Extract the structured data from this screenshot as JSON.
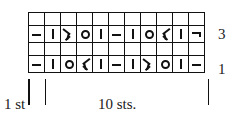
{
  "figure": {
    "kind": "knitting-stitch-chart",
    "background_color": "#ffffff",
    "line_color": "#111111"
  },
  "chart_data": {
    "type": "heatmap",
    "title": "",
    "subtitle": "",
    "xlabel": "",
    "ylabel": "",
    "grid": true,
    "legend_position": "none",
    "columns": 11,
    "rows": 4,
    "row_labels": [
      "3",
      "",
      "1",
      ""
    ],
    "symbol_legend": {
      "dash": "purl-stitch",
      "bar": "knit-stitch",
      "circle": "yarn-over",
      "dec-left": "left-leaning-decrease",
      "dec-right": "right-leaning-decrease",
      "hook": "purl-stitch-end"
    },
    "grid_rows": [
      {
        "label": "",
        "cells": [
          "",
          "",
          "",
          "",
          "",
          "",
          "",
          "",
          "",
          "",
          ""
        ]
      },
      {
        "label": "3",
        "cells": [
          "dash",
          "bar",
          "dec-left",
          "circle",
          "bar",
          "dash",
          "bar",
          "circle",
          "dec-right",
          "bar",
          "hook"
        ]
      },
      {
        "label": "",
        "cells": [
          "",
          "",
          "",
          "",
          "",
          "",
          "",
          "",
          "",
          "",
          ""
        ]
      },
      {
        "label": "1",
        "cells": [
          "dash",
          "bar",
          "circle",
          "dec-right",
          "bar",
          "dash",
          "bar",
          "dec-left",
          "circle",
          "bar",
          "dash"
        ]
      }
    ],
    "annotations": [
      {
        "text": "1 st",
        "position": "below-left"
      },
      {
        "text": "10 sts.",
        "position": "below-center"
      }
    ]
  },
  "row_numbers": {
    "upper": "3",
    "lower": "1"
  },
  "labels": {
    "first_stitch": "1 st",
    "repeat_stitches": "10 sts."
  }
}
